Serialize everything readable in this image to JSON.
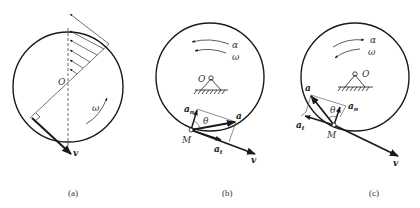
{
  "panels": [
    {
      "caption": "(a)",
      "labels": {
        "center": "O",
        "omega": "ω",
        "velocity": "v"
      }
    },
    {
      "caption": "(b)",
      "labels": {
        "center": "O",
        "alpha": "α",
        "omega": "ω",
        "point": "M",
        "theta": "θ",
        "accel": "a",
        "normal": "a",
        "normal_sub": "n",
        "tangential": "a",
        "tangential_sub": "t",
        "velocity": "v"
      }
    },
    {
      "caption": "(c)",
      "labels": {
        "center": "O",
        "alpha": "α",
        "omega": "ω",
        "point": "M",
        "theta": "θ",
        "accel": "a",
        "normal": "a",
        "normal_sub": "n",
        "tangential": "a",
        "tangential_sub": "t",
        "velocity": "v"
      }
    }
  ],
  "colors": {
    "stroke": "#1a1a1a",
    "text": "#333333"
  }
}
